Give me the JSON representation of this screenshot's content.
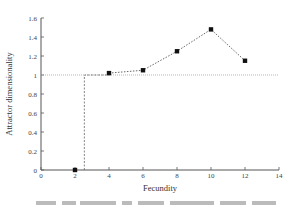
{
  "chart_data": {
    "type": "line",
    "title": "",
    "xlabel": "Fecundity",
    "ylabel": "Attractor dimensionality",
    "xlim": [
      0,
      14
    ],
    "ylim": [
      0,
      1.6
    ],
    "x_ticks": [
      0,
      2,
      4,
      6,
      8,
      10,
      12,
      14
    ],
    "y_ticks": [
      0,
      0.2,
      0.4,
      0.6,
      0.8,
      1,
      1.2,
      1.4,
      1.6
    ],
    "x_tick_labels": [
      "0",
      "2",
      "4",
      "6",
      "8",
      "10",
      "12",
      "14"
    ],
    "y_tick_labels": [
      "0",
      "0.2",
      "0.4",
      "0.6",
      "0.8",
      "1",
      "1.2",
      "1.4",
      "1.6"
    ],
    "grid": false,
    "legend": null,
    "series": [
      {
        "name": "Attractor dimensionality",
        "marker": "square",
        "line_style": "dotted",
        "x": [
          2,
          4,
          6,
          8,
          10,
          12
        ],
        "values": [
          0,
          1.02,
          1.05,
          1.25,
          1.48,
          1.15
        ]
      }
    ],
    "annotations": [
      {
        "type": "hline",
        "y": 1,
        "x_range": [
          0,
          14
        ],
        "style": "dotted"
      },
      {
        "type": "step",
        "points": [
          [
            2.55,
            0
          ],
          [
            2.55,
            1
          ],
          [
            4,
            1
          ]
        ],
        "style": "dashed"
      }
    ]
  },
  "caption": {
    "visible_text": ""
  }
}
